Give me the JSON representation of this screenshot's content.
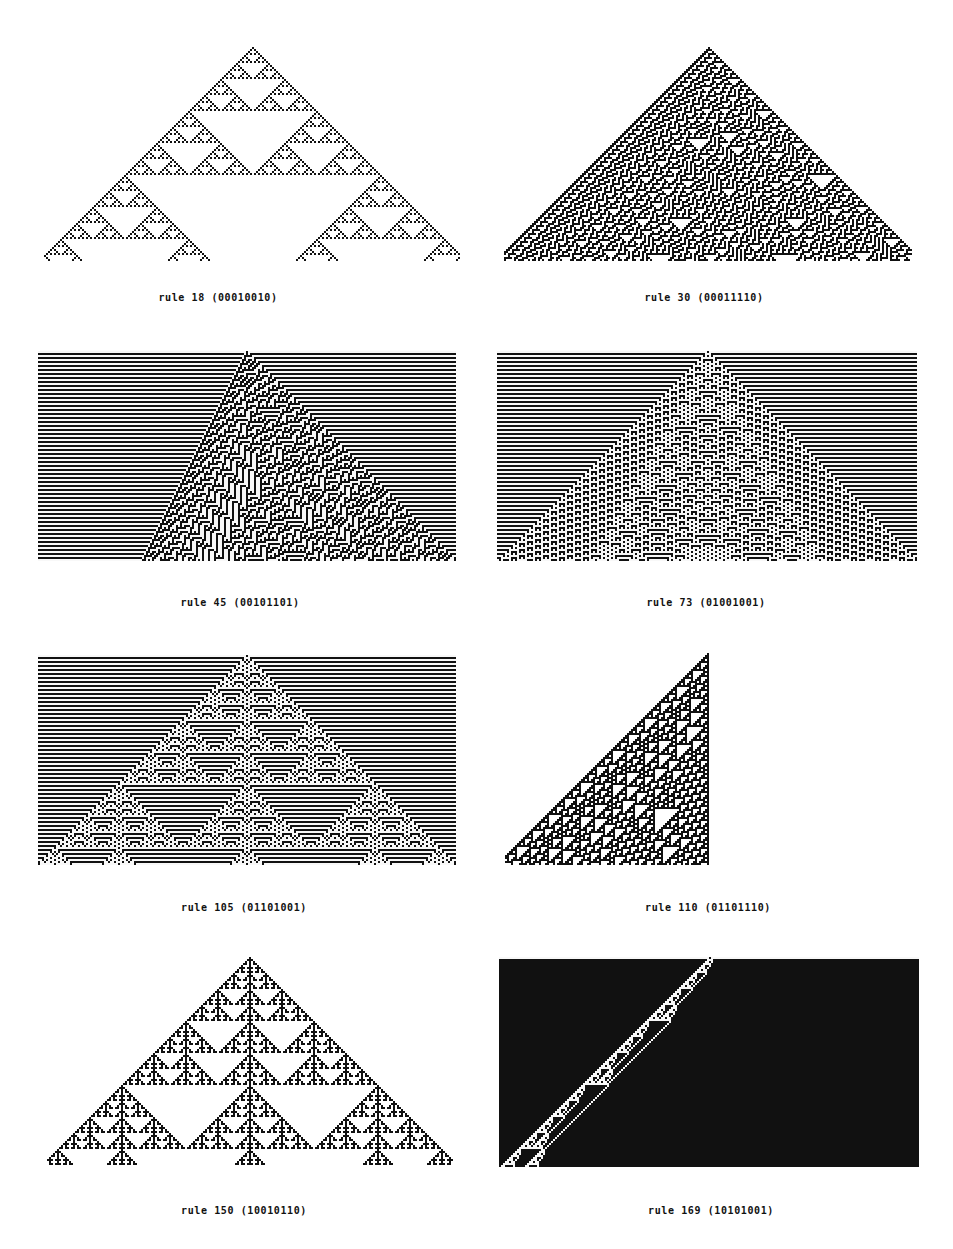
{
  "figure": {
    "colors": {
      "on": "#111111",
      "off": "#ffffff",
      "background": "#ffffff"
    },
    "panels": [
      {
        "id": "rule-18",
        "rule": 18,
        "binary": "00010010",
        "caption": "rule 18 (00010010)",
        "init": "single",
        "mode": "triangle",
        "box": {
          "x": 44,
          "y": 47,
          "w": 416,
          "h": 214
        },
        "caption_pos": {
          "x": 218,
          "y": 299
        }
      },
      {
        "id": "rule-30",
        "rule": 30,
        "binary": "00011110",
        "caption": "rule 30 (00011110)",
        "init": "single",
        "mode": "triangle",
        "box": {
          "x": 504,
          "y": 47,
          "w": 408,
          "h": 214
        },
        "caption_pos": {
          "x": 704,
          "y": 299
        }
      },
      {
        "id": "rule-45",
        "rule": 45,
        "binary": "00101101",
        "caption": "rule 45 (00101101)",
        "init": "single",
        "mode": "full",
        "box": {
          "x": 38,
          "y": 351,
          "w": 418,
          "h": 211
        },
        "caption_pos": {
          "x": 240,
          "y": 604
        }
      },
      {
        "id": "rule-73",
        "rule": 73,
        "binary": "01001001",
        "caption": "rule 73 (01001001)",
        "init": "single",
        "mode": "full",
        "box": {
          "x": 497,
          "y": 351,
          "w": 421,
          "h": 211
        },
        "caption_pos": {
          "x": 706,
          "y": 604
        }
      },
      {
        "id": "rule-105",
        "rule": 105,
        "binary": "01101001",
        "caption": "rule 105 (01101001)",
        "init": "single",
        "mode": "full",
        "box": {
          "x": 38,
          "y": 655,
          "w": 418,
          "h": 210
        },
        "caption_pos": {
          "x": 244,
          "y": 909
        }
      },
      {
        "id": "rule-110",
        "rule": 110,
        "binary": "01101110",
        "caption": "rule 110 (01101110)",
        "init": "single-right",
        "mode": "left-triangle",
        "box": {
          "x": 505,
          "y": 653,
          "w": 205,
          "h": 212
        },
        "caption_pos": {
          "x": 708,
          "y": 909
        }
      },
      {
        "id": "rule-150",
        "rule": 150,
        "binary": "10010110",
        "caption": "rule 150 (10010110)",
        "init": "single",
        "mode": "triangle",
        "box": {
          "x": 47,
          "y": 957,
          "w": 407,
          "h": 209
        },
        "caption_pos": {
          "x": 244,
          "y": 1212
        }
      },
      {
        "id": "rule-169",
        "rule": 169,
        "binary": "10101001",
        "caption": "rule 169 (10101001)",
        "init": "single",
        "mode": "full",
        "box": {
          "x": 499,
          "y": 957,
          "w": 421,
          "h": 210
        },
        "caption_pos": {
          "x": 711,
          "y": 1212
        }
      }
    ]
  }
}
